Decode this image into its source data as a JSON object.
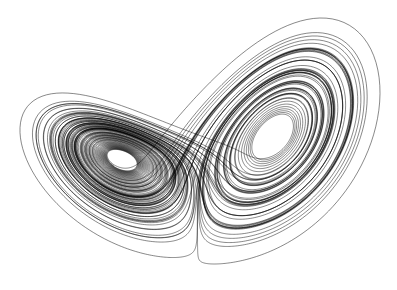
{
  "image": {
    "subject": "Lorenz attractor",
    "description": "Black thin-line trajectory of the Lorenz system forming two spiral lobes (butterfly shape) on white background",
    "width": 397,
    "height": 290,
    "background_color": "#ffffff",
    "line_color": "#000000"
  },
  "lorenz": {
    "sigma": 10,
    "rho": 28,
    "beta": 2.6666667,
    "dt": 0.004,
    "steps": 26000,
    "initial": [
      0.1,
      0.0,
      0.0
    ]
  },
  "layout": {
    "bounds": {
      "left": 20,
      "right": 380,
      "top": 18,
      "bottom": 264
    },
    "left_eye_center": [
      125,
      150
    ],
    "right_eye_center": [
      265,
      130
    ]
  }
}
